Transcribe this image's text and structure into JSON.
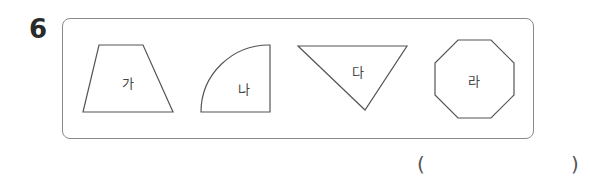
{
  "question": {
    "number": "6"
  },
  "shapes": [
    {
      "id": "trapezoid",
      "label": "가"
    },
    {
      "id": "quarter-circle",
      "label": "나"
    },
    {
      "id": "inverted-triangle",
      "label": "다"
    },
    {
      "id": "octagon",
      "label": "라"
    }
  ],
  "answer": {
    "open_paren": "(",
    "close_paren": ")",
    "value": ""
  },
  "colors": {
    "stroke": "#555555",
    "box_border": "#8a8a8a",
    "text": "#2a2a2a"
  }
}
